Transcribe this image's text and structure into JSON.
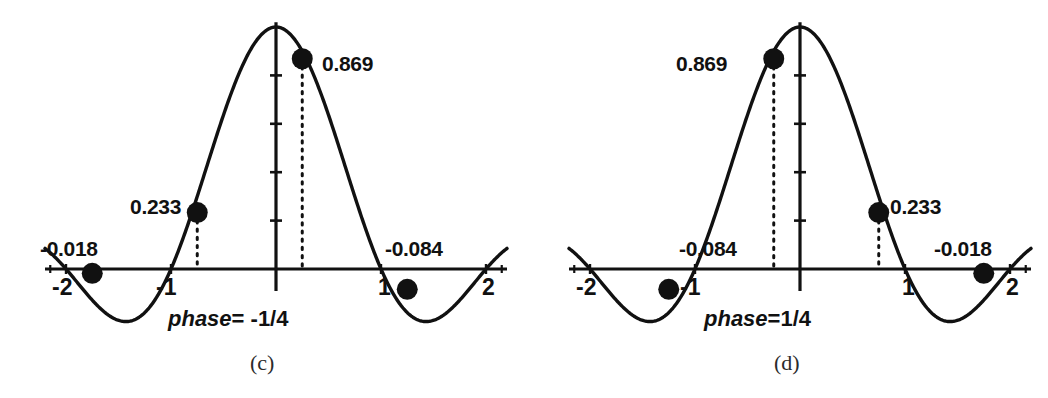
{
  "figure": {
    "background": "#ffffff",
    "ink_color": "#111111",
    "panels": [
      {
        "id": "c",
        "sub_label": "(c)",
        "phase_word": "phase",
        "phase_value": "= -1/4",
        "phase_full": "phase= -1/4",
        "axis": {
          "x_ticks": [
            "-2",
            "-1",
            "1",
            "2"
          ],
          "x_tick_values": [
            -2,
            -1,
            1,
            2
          ],
          "xlim": [
            -2.2,
            2.2
          ],
          "ylim": [
            -0.25,
            1.05
          ],
          "y_ticks_count": 4,
          "grid": false
        },
        "points": [
          {
            "label": "-0.018",
            "x": -1.75,
            "y": -0.018,
            "label_pos": "above-left"
          },
          {
            "label": "0.233",
            "x": -0.75,
            "y": 0.233,
            "label_pos": "left"
          },
          {
            "label": "0.869",
            "x": 0.25,
            "y": 0.869,
            "label_pos": "right"
          },
          {
            "label": "-0.084",
            "x": 1.25,
            "y": -0.084,
            "label_pos": "above-right"
          }
        ]
      },
      {
        "id": "d",
        "sub_label": "(d)",
        "phase_word": "phase",
        "phase_value": "=1/4",
        "phase_full": "phase=1/4",
        "axis": {
          "x_ticks": [
            "-2",
            "-1",
            "1",
            "2"
          ],
          "x_tick_values": [
            -2,
            -1,
            1,
            2
          ],
          "xlim": [
            -2.2,
            2.2
          ],
          "ylim": [
            -0.25,
            1.05
          ],
          "y_ticks_count": 4,
          "grid": false
        },
        "points": [
          {
            "label": "-0.084",
            "x": -1.25,
            "y": -0.084,
            "label_pos": "above-left"
          },
          {
            "label": "0.869",
            "x": -0.25,
            "y": 0.869,
            "label_pos": "left"
          },
          {
            "label": "0.233",
            "x": 0.75,
            "y": 0.233,
            "label_pos": "right"
          },
          {
            "label": "-0.018",
            "x": 1.75,
            "y": -0.018,
            "label_pos": "above-right"
          }
        ]
      }
    ]
  },
  "chart_data": [
    {
      "type": "line",
      "title": "phase= -1/4",
      "subtitle": "(c)",
      "xlabel": "",
      "ylabel": "",
      "xlim": [
        -2.2,
        2.2
      ],
      "ylim": [
        -0.25,
        1.05
      ],
      "grid": false,
      "legend": "none",
      "function": "sinc(t)",
      "x_tick_labels": [
        "-2",
        "-1",
        "1",
        "2"
      ],
      "x_tick_values": [
        -2,
        -1,
        1,
        2
      ],
      "y_tick_values": [
        0.2,
        0.4,
        0.6,
        0.8
      ],
      "sample_phase": -0.25,
      "series": [
        {
          "name": "sinc curve",
          "x": [
            -2.2,
            -2.0,
            -1.8,
            -1.6,
            -1.5,
            -1.4,
            -1.2,
            -1.0,
            -0.8,
            -0.6,
            -0.4,
            -0.2,
            0.0,
            0.2,
            0.4,
            0.6,
            0.8,
            1.0,
            1.2,
            1.4,
            1.5,
            1.6,
            1.8,
            2.0,
            2.2
          ],
          "values": [
            0.035,
            0.0,
            -0.042,
            -0.063,
            -0.064,
            -0.055,
            0.0,
            0.0,
            0.234,
            0.505,
            0.757,
            0.935,
            1.0,
            0.935,
            0.757,
            0.505,
            0.234,
            0.0,
            -0.055,
            -0.042,
            -0.021,
            0.0,
            0.035,
            0.0,
            -0.029
          ]
        },
        {
          "name": "samples",
          "x": [
            -1.75,
            -0.75,
            0.25,
            1.25
          ],
          "values": [
            -0.018,
            0.233,
            0.869,
            -0.084
          ],
          "labels": [
            "-0.018",
            "0.233",
            "0.869",
            "-0.084"
          ],
          "marker": "filled-circle"
        }
      ]
    },
    {
      "type": "line",
      "title": "phase=1/4",
      "subtitle": "(d)",
      "xlabel": "",
      "ylabel": "",
      "xlim": [
        -2.2,
        2.2
      ],
      "ylim": [
        -0.25,
        1.05
      ],
      "grid": false,
      "legend": "none",
      "function": "sinc(t)",
      "x_tick_labels": [
        "-2",
        "-1",
        "1",
        "2"
      ],
      "x_tick_values": [
        -2,
        -1,
        1,
        2
      ],
      "y_tick_values": [
        0.2,
        0.4,
        0.6,
        0.8
      ],
      "sample_phase": 0.25,
      "series": [
        {
          "name": "sinc curve",
          "x": [
            -2.2,
            -2.0,
            -1.8,
            -1.6,
            -1.5,
            -1.4,
            -1.2,
            -1.0,
            -0.8,
            -0.6,
            -0.4,
            -0.2,
            0.0,
            0.2,
            0.4,
            0.6,
            0.8,
            1.0,
            1.2,
            1.4,
            1.5,
            1.6,
            1.8,
            2.0,
            2.2
          ],
          "values": [
            -0.029,
            0.0,
            0.035,
            -0.021,
            -0.042,
            -0.055,
            -0.064,
            0.0,
            0.234,
            0.505,
            0.757,
            0.935,
            1.0,
            0.935,
            0.757,
            0.505,
            0.234,
            0.0,
            -0.055,
            -0.064,
            -0.063,
            -0.042,
            0.0,
            0.035,
            0.0
          ]
        },
        {
          "name": "samples",
          "x": [
            -1.25,
            -0.25,
            0.75,
            1.75
          ],
          "values": [
            -0.084,
            0.869,
            0.233,
            -0.018
          ],
          "labels": [
            "-0.084",
            "0.869",
            "0.233",
            "-0.018"
          ],
          "marker": "filled-circle"
        }
      ]
    }
  ]
}
